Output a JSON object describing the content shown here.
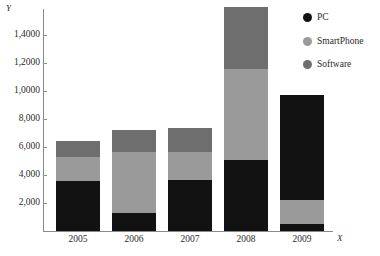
{
  "chart_data": {
    "type": "bar",
    "subtype": "stacked",
    "title": "",
    "xlabel": "X",
    "ylabel": "Y",
    "categories": [
      "2005",
      "2006",
      "2007",
      "2008",
      "2009"
    ],
    "ytick_labels": [
      "2,000",
      "4,000",
      "6,000",
      "8,000",
      "1,0000",
      "1,2000",
      "1,4000"
    ],
    "ytick_values": [
      2000,
      4000,
      6000,
      8000,
      10000,
      12000,
      14000
    ],
    "ylim": [
      0,
      16000
    ],
    "grid": false,
    "legend_position": "right-top",
    "series": [
      {
        "name": "PC",
        "color": "#121212",
        "values": [
          3570,
          1290,
          3640,
          5070,
          500
        ]
      },
      {
        "name": "SmartPhone",
        "color": "#9a9a9a",
        "values": [
          1700,
          4360,
          2000,
          6500,
          1700
        ]
      },
      {
        "name": "Software",
        "color": "#6e6e6e",
        "values": [
          1140,
          1570,
          1710,
          4430,
          7500
        ]
      }
    ],
    "bar_stack_order": [
      [
        "PC",
        "SmartPhone",
        "Software"
      ],
      [
        "PC",
        "SmartPhone",
        "Software"
      ],
      [
        "PC",
        "SmartPhone",
        "Software"
      ],
      [
        "PC",
        "SmartPhone",
        "Software"
      ],
      [
        "PC",
        "SmartPhone",
        "PC"
      ]
    ],
    "bar_totals": [
      6410,
      7220,
      7350,
      16000,
      9700
    ],
    "legend": [
      {
        "label": "PC",
        "color": "#121212",
        "marker": "circle"
      },
      {
        "label": "SmartPhone",
        "color": "#9a9a9a",
        "marker": "circle"
      },
      {
        "label": "Software",
        "color": "#6e6e6e",
        "marker": "circle"
      }
    ],
    "colors": {
      "pc": "#121212",
      "smartphone": "#9a9a9a",
      "software": "#6e6e6e",
      "axis": "#8a8a8a",
      "text": "#2b2b2b",
      "background": "#ffffff"
    },
    "bars": [
      {
        "category": "2005",
        "total": 6410,
        "segments": [
          {
            "series": "PC",
            "value": 3570,
            "color": "#121212"
          },
          {
            "series": "SmartPhone",
            "value": 1700,
            "color": "#9a9a9a"
          },
          {
            "series": "Software",
            "value": 1140,
            "color": "#6e6e6e"
          }
        ]
      },
      {
        "category": "2006",
        "total": 7220,
        "segments": [
          {
            "series": "PC",
            "value": 1290,
            "color": "#121212"
          },
          {
            "series": "SmartPhone",
            "value": 4360,
            "color": "#9a9a9a"
          },
          {
            "series": "Software",
            "value": 1570,
            "color": "#6e6e6e"
          }
        ]
      },
      {
        "category": "2007",
        "total": 7350,
        "segments": [
          {
            "series": "PC",
            "value": 3640,
            "color": "#121212"
          },
          {
            "series": "SmartPhone",
            "value": 2000,
            "color": "#9a9a9a"
          },
          {
            "series": "Software",
            "value": 1710,
            "color": "#6e6e6e"
          }
        ]
      },
      {
        "category": "2008",
        "total": 16000,
        "segments": [
          {
            "series": "PC",
            "value": 5070,
            "color": "#121212"
          },
          {
            "series": "SmartPhone",
            "value": 6500,
            "color": "#9a9a9a"
          },
          {
            "series": "Software",
            "value": 4430,
            "color": "#6e6e6e"
          }
        ]
      },
      {
        "category": "2009",
        "total": 9700,
        "segments": [
          {
            "series": "PC",
            "value": 500,
            "color": "#121212"
          },
          {
            "series": "SmartPhone",
            "value": 1700,
            "color": "#9a9a9a"
          },
          {
            "series": "PC",
            "value": 7500,
            "color": "#121212"
          }
        ]
      }
    ]
  }
}
